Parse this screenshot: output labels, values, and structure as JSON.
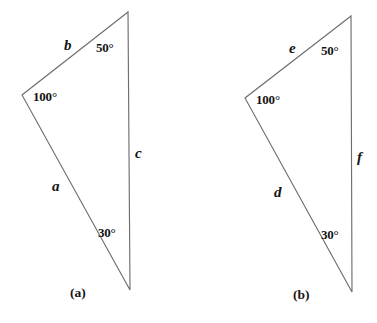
{
  "figure": {
    "kind": "geometry-figure",
    "background_color": "#ffffff",
    "stroke_color": "#6e6e6e",
    "text_color": "#141414"
  },
  "panels": [
    {
      "id": "a",
      "caption": "(a)",
      "vertices": {
        "top": [
          128,
          12
        ],
        "left": [
          22,
          95
        ],
        "bottom": [
          130,
          290
        ]
      },
      "angles": [
        {
          "name": "angle-top",
          "value": "50°",
          "at_vertex": "top"
        },
        {
          "name": "angle-left",
          "value": "100°",
          "at_vertex": "left"
        },
        {
          "name": "angle-bottom",
          "value": "30°",
          "at_vertex": "bottom"
        }
      ],
      "sides": [
        {
          "name": "side-upper-left",
          "label": "b"
        },
        {
          "name": "side-lower-left",
          "label": "a"
        },
        {
          "name": "side-right",
          "label": "c"
        }
      ]
    },
    {
      "id": "b",
      "caption": "(b)",
      "vertices": {
        "top": [
          351,
          16
        ],
        "left": [
          245,
          98
        ],
        "bottom": [
          352,
          292
        ]
      },
      "angles": [
        {
          "name": "angle-top",
          "value": "50°",
          "at_vertex": "top"
        },
        {
          "name": "angle-left",
          "value": "100°",
          "at_vertex": "left"
        },
        {
          "name": "angle-bottom",
          "value": "30°",
          "at_vertex": "bottom"
        }
      ],
      "sides": [
        {
          "name": "side-upper-left",
          "label": "e"
        },
        {
          "name": "side-lower-left",
          "label": "d"
        },
        {
          "name": "side-right",
          "label": "f"
        }
      ]
    }
  ],
  "labels": {
    "a": {
      "side_b": "b",
      "side_a": "a",
      "side_c": "c",
      "angle_50": "50°",
      "angle_100": "100°",
      "angle_30": "30°",
      "caption": "(a)"
    },
    "b": {
      "side_e": "e",
      "side_d": "d",
      "side_f": "f",
      "angle_50": "50°",
      "angle_100": "100°",
      "angle_30": "30°",
      "caption": "(b)"
    }
  }
}
